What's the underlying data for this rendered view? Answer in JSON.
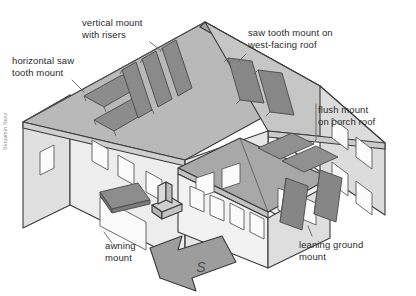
{
  "illustration": {
    "title": "Solar panel mounting types on a house",
    "credit": "Benjamin Nusz",
    "background_color": "#ffffff",
    "palette": {
      "line": "#3a3a3a",
      "roof_left": "#b8b8b8",
      "roof_right": "#c9c9c9",
      "roof_porch": "#a9a9a9",
      "wall_light": "#ededed",
      "wall_shade": "#d4d4d4",
      "panel_dark": "#8a8a8a",
      "panel_mid": "#9a9a9a",
      "window_fill": "#fbfbfb",
      "arrow_fill": "#9d9d9d",
      "text": "#2b2b2b"
    }
  },
  "labels": [
    {
      "id": "horizontal-saw-tooth-mount",
      "text": "horizontal saw\ntooth mount",
      "x": 12,
      "y": 55,
      "align": "left"
    },
    {
      "id": "vertical-mount-with-risers",
      "text": "vertical mount\nwith risers",
      "x": 82,
      "y": 17,
      "align": "left"
    },
    {
      "id": "saw-tooth-mount-on-west-facing-roof",
      "text": "saw tooth mount on\nwest-facing roof",
      "x": 248,
      "y": 27,
      "align": "left"
    },
    {
      "id": "flush-mount-on-porch-roof",
      "text": "flush mount\non porch roof",
      "x": 318,
      "y": 104,
      "align": "left"
    },
    {
      "id": "awning-mount",
      "text": "awning\nmount",
      "x": 105,
      "y": 240,
      "align": "left"
    },
    {
      "id": "leaning-ground-mount",
      "text": "leaning ground\nmount",
      "x": 299,
      "y": 239,
      "align": "left"
    }
  ],
  "compass": {
    "direction_letter": "S",
    "description": "south-pointing arrow"
  },
  "mount_types": [
    "horizontal saw tooth mount",
    "vertical mount with risers",
    "saw tooth mount on west-facing roof",
    "flush mount on porch roof",
    "awning mount",
    "leaning ground mount"
  ]
}
